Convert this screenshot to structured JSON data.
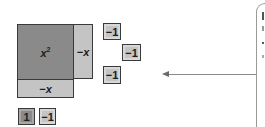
{
  "diagram": {
    "type": "algebra-tiles",
    "tiles": [
      {
        "id": "x-squared",
        "label": "x",
        "exponent": "2",
        "shade": "dark",
        "box": [
          17,
          24,
          56,
          55
        ]
      },
      {
        "id": "neg-x-vertical",
        "label": "−x",
        "shade": "light",
        "box": [
          73,
          24,
          19,
          54
        ]
      },
      {
        "id": "neg-x-horizontal",
        "label": "−x",
        "shade": "light",
        "box": [
          17,
          79,
          57,
          18
        ]
      },
      {
        "id": "neg-one-a",
        "label": "−1",
        "shade": "light",
        "box": [
          103,
          23,
          17,
          16
        ]
      },
      {
        "id": "neg-one-b",
        "label": "−1",
        "shade": "light",
        "box": [
          122,
          44,
          18,
          16
        ]
      },
      {
        "id": "neg-one-c",
        "label": "−1",
        "shade": "light",
        "box": [
          103,
          66,
          17,
          17
        ]
      },
      {
        "id": "one",
        "label": "1",
        "shade": "dark",
        "box": [
          18,
          108,
          16,
          16
        ]
      },
      {
        "id": "neg-one-d",
        "label": "−1",
        "shade": "light",
        "box": [
          39,
          108,
          16,
          16
        ]
      }
    ],
    "arrow": {
      "from": [
        256,
        74
      ],
      "to": [
        162,
        74
      ],
      "direction": "left"
    },
    "callout": {
      "type": "bracket",
      "text_visible": false,
      "note": "callout text cut off at right edge"
    },
    "colors": {
      "dark_tile": "#8a8a8a",
      "light_tile": "#c4c4c4",
      "border": "#3a3a3a",
      "arrow": "#8a8a8a"
    }
  }
}
